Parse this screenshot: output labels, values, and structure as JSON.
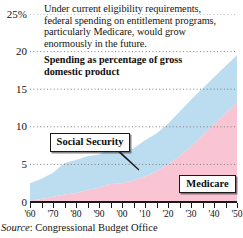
{
  "figure": {
    "headnote": "Under current eligibility requirements, federal spending on entitlement programs, particularly Medicare, would grow enormously in the future.",
    "subtitle": "Spending as percentage of gross domestic product",
    "source_label": "Source",
    "source_value": "Congressional Budget Office"
  },
  "callouts": {
    "social_security": "Social Security",
    "medicare": "Medicare"
  },
  "colors": {
    "social_security": "#bcdcf0",
    "medicare": "#f9c4d4",
    "axis": "#1a1a1a",
    "gridline": "#7d7d7d",
    "text": "#141414",
    "background": "#ffffff"
  },
  "chart_data": {
    "type": "area",
    "stacked": true,
    "title": "",
    "subtitle": "Spending as percentage of gross domestic product",
    "annotation": "Under current eligibility requirements, federal spending on entitlement programs, particularly Medicare, would grow enormously in the future.",
    "xlabel": "",
    "ylabel": "Percentage of gross domestic product",
    "xlim": [
      1960,
      2050
    ],
    "ylim": [
      0,
      25
    ],
    "yticks": [
      0,
      5,
      10,
      15,
      20,
      25
    ],
    "ytick_labels": [
      "0",
      "5",
      "10",
      "15",
      "20",
      "25%"
    ],
    "xticks": [
      1960,
      1965,
      1970,
      1975,
      1980,
      1985,
      1990,
      1995,
      2000,
      2005,
      2010,
      2015,
      2020,
      2025,
      2030,
      2035,
      2040,
      2045,
      2050
    ],
    "xtick_labels": [
      "'60",
      "",
      "'70",
      "",
      "'80",
      "",
      "'90",
      "",
      "'00",
      "",
      "'10",
      "",
      "'20",
      "",
      "'30",
      "",
      "'40",
      "",
      "'50"
    ],
    "xtick_labeled": [
      1960,
      1970,
      1980,
      1990,
      2000,
      2010,
      2020,
      2030,
      2040,
      2050
    ],
    "grid": "horizontal-dotted",
    "legend": "inline-callouts",
    "legend_entries": [
      "Social Security",
      "Medicare"
    ],
    "x": [
      1960,
      1965,
      1970,
      1975,
      1980,
      1985,
      1990,
      1995,
      2000,
      2005,
      2010,
      2015,
      2020,
      2025,
      2030,
      2035,
      2040,
      2045,
      2050
    ],
    "series": [
      {
        "name": "Medicare",
        "color": "#f9c4d4",
        "values": [
          0.2,
          0.4,
          0.7,
          1.0,
          1.2,
          1.6,
          1.9,
          2.4,
          2.5,
          2.9,
          3.4,
          4.1,
          5.0,
          6.1,
          7.4,
          8.8,
          10.3,
          11.8,
          13.2
        ]
      },
      {
        "name": "Social Security",
        "color": "#bcdcf0",
        "values": [
          2.3,
          2.7,
          3.2,
          4.2,
          4.4,
          4.5,
          4.4,
          4.6,
          4.2,
          4.2,
          4.8,
          5.0,
          5.4,
          5.9,
          6.2,
          6.3,
          6.3,
          6.3,
          6.3
        ]
      }
    ],
    "totals": [
      2.5,
      3.1,
      3.9,
      5.2,
      5.6,
      6.1,
      6.3,
      7.0,
      6.7,
      7.1,
      8.2,
      9.1,
      10.4,
      12.0,
      13.6,
      15.1,
      16.6,
      18.1,
      19.5
    ]
  }
}
